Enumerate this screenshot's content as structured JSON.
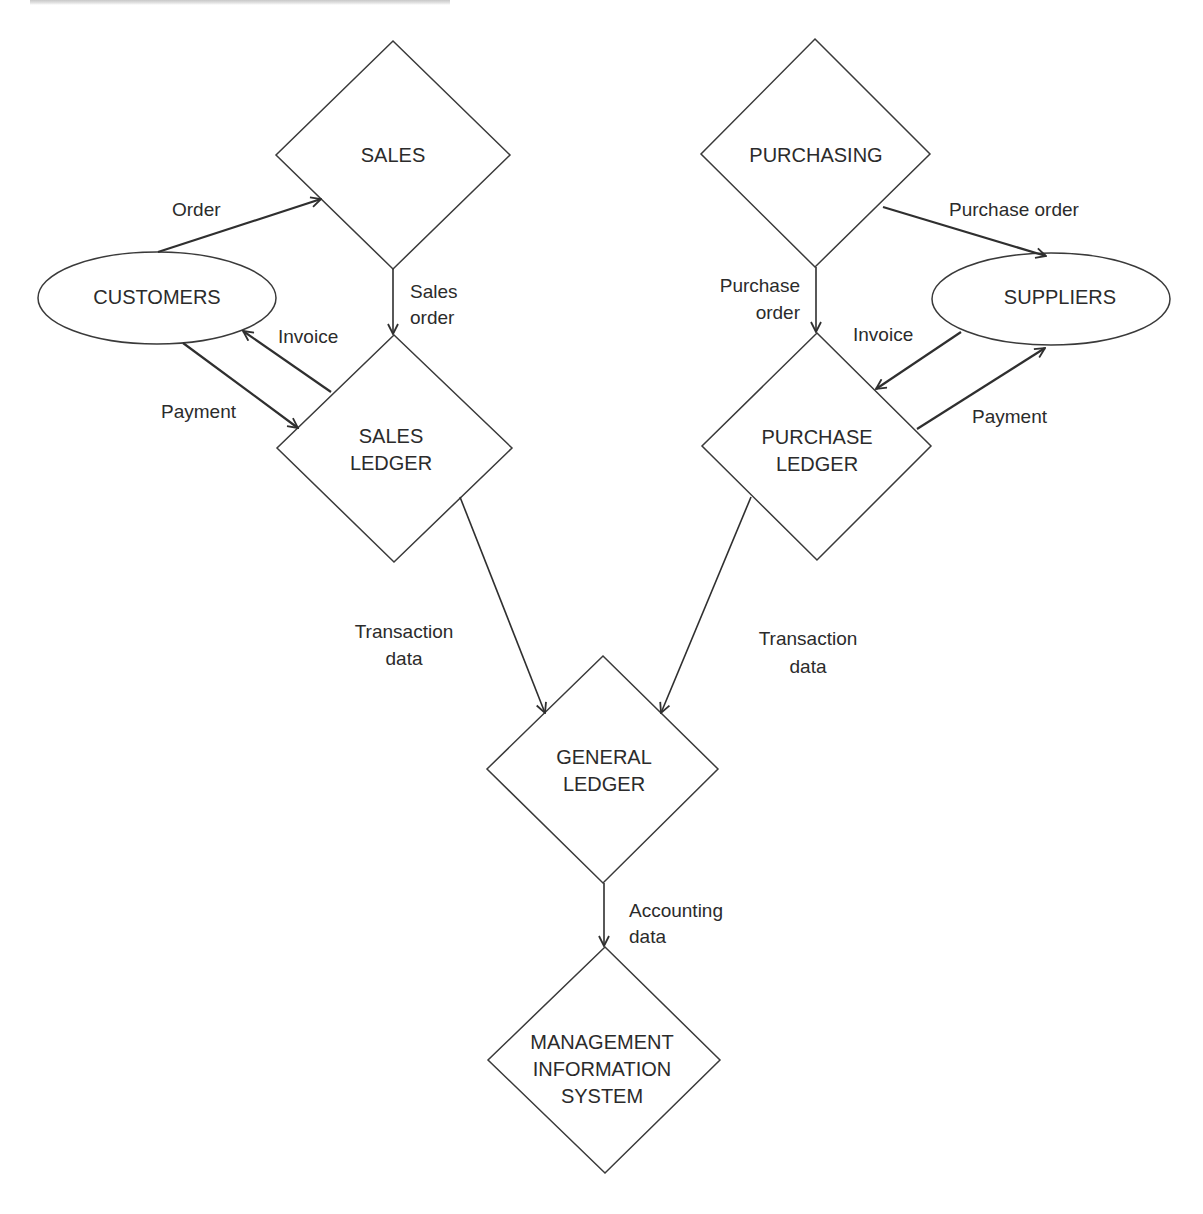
{
  "diagram": {
    "nodes": {
      "sales": {
        "shape": "diamond",
        "lines": [
          "SALES"
        ]
      },
      "purchasing": {
        "shape": "diamond",
        "lines": [
          "PURCHASING"
        ]
      },
      "customers": {
        "shape": "ellipse",
        "lines": [
          "CUSTOMERS"
        ]
      },
      "suppliers": {
        "shape": "ellipse",
        "lines": [
          "SUPPLIERS"
        ]
      },
      "sales_ledger": {
        "shape": "diamond",
        "lines": [
          "SALES",
          "LEDGER"
        ]
      },
      "purchase_ledger": {
        "shape": "diamond",
        "lines": [
          "PURCHASE",
          "LEDGER"
        ]
      },
      "general_ledger": {
        "shape": "diamond",
        "lines": [
          "GENERAL",
          "LEDGER"
        ]
      },
      "mis": {
        "shape": "diamond",
        "lines": [
          "MANAGEMENT",
          "INFORMATION",
          "SYSTEM"
        ]
      }
    },
    "edges": {
      "order": {
        "from": "CUSTOMERS",
        "to": "SALES",
        "lines": [
          "Order"
        ]
      },
      "sales_order": {
        "from": "SALES",
        "to": "SALES LEDGER",
        "lines": [
          "Sales",
          "order"
        ]
      },
      "customer_invoice": {
        "from": "SALES LEDGER",
        "to": "CUSTOMERS",
        "lines": [
          "Invoice"
        ]
      },
      "customer_payment": {
        "from": "CUSTOMERS",
        "to": "SALES LEDGER",
        "lines": [
          "Payment"
        ]
      },
      "purchase_order_supplier": {
        "from": "PURCHASING",
        "to": "SUPPLIERS",
        "lines": [
          "Purchase order"
        ]
      },
      "purchase_order_ledger": {
        "from": "PURCHASING",
        "to": "PURCHASE LEDGER",
        "lines": [
          "Purchase",
          "order"
        ]
      },
      "supplier_invoice": {
        "from": "SUPPLIERS",
        "to": "PURCHASE LEDGER",
        "lines": [
          "Invoice"
        ]
      },
      "supplier_payment": {
        "from": "PURCHASE LEDGER",
        "to": "SUPPLIERS",
        "lines": [
          "Payment"
        ]
      },
      "transaction_left": {
        "from": "SALES LEDGER",
        "to": "GENERAL LEDGER",
        "lines": [
          "Transaction",
          "data"
        ]
      },
      "transaction_right": {
        "from": "PURCHASE LEDGER",
        "to": "GENERAL LEDGER",
        "lines": [
          "Transaction",
          "data"
        ]
      },
      "accounting": {
        "from": "GENERAL LEDGER",
        "to": "MANAGEMENT INFORMATION SYSTEM",
        "lines": [
          "Accounting",
          "data"
        ]
      }
    },
    "colors": {
      "line": "#2f2f2f",
      "text": "#2b2b2b",
      "background": "#ffffff"
    }
  }
}
